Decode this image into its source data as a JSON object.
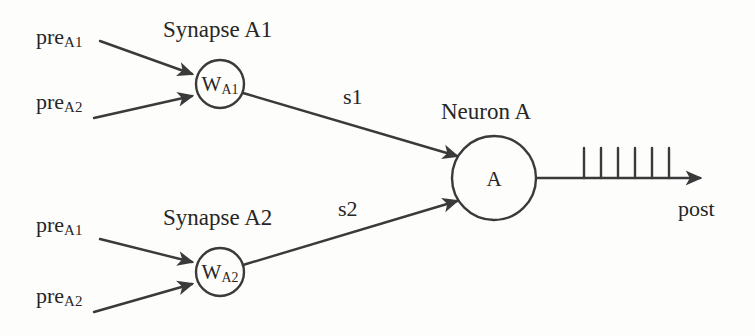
{
  "diagram": {
    "type": "neural-schematic",
    "background_color": "#fdfdfc",
    "stroke_color": "#3a3a3a",
    "text_color": "#262626",
    "labels": {
      "synapse_a1_title": "Synapse A1",
      "synapse_a2_title": "Synapse A2",
      "neuron_title": "Neuron A",
      "signal_s1": "s1",
      "signal_s2": "s2",
      "output_post": "post",
      "pre_base": "pre",
      "pre_sub_a1": "A1",
      "pre_sub_a2": "A2",
      "weight_base": "W",
      "weight_sub_a1": "A1",
      "weight_sub_a2": "A2",
      "neuron_body": "A"
    },
    "nodes": [
      {
        "id": "synapse-a1",
        "label_base": "W",
        "label_sub": "A1",
        "cx": 220,
        "cy": 84,
        "r": 24
      },
      {
        "id": "synapse-a2",
        "label_base": "W",
        "label_sub": "A2",
        "cx": 220,
        "cy": 272,
        "r": 24
      },
      {
        "id": "neuron-a",
        "label_base": "A",
        "label_sub": "",
        "cx": 494,
        "cy": 178,
        "r": 42
      }
    ],
    "inputs": [
      {
        "id": "pre-a1-top",
        "label_base": "pre",
        "label_sub": "A1",
        "x": 36,
        "y": 30
      },
      {
        "id": "pre-a2-top",
        "label_base": "pre",
        "label_sub": "A2",
        "x": 36,
        "y": 95
      },
      {
        "id": "pre-a1-bottom",
        "label_base": "pre",
        "label_sub": "A1",
        "x": 36,
        "y": 218
      },
      {
        "id": "pre-a2-bottom",
        "label_base": "pre",
        "label_sub": "A2",
        "x": 36,
        "y": 288
      }
    ],
    "spike_train": {
      "count": 6,
      "baseline_y": 178,
      "tick_height": 30,
      "first_x": 584,
      "spacing": 17
    }
  }
}
